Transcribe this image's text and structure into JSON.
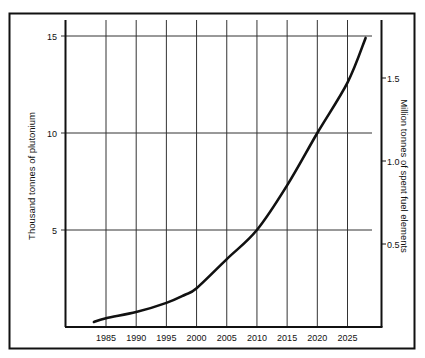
{
  "chart_data": {
    "type": "line",
    "title": "",
    "xlabel": "",
    "ylabel": "Thousand tonnes of plutonium",
    "y2label": "Million tonnes of spent fuel elements",
    "x_ticks": [
      "1985",
      "1990",
      "1995",
      "2000",
      "2005",
      "2010",
      "2015",
      "2020",
      "2025"
    ],
    "y_ticks": [
      "5",
      "10",
      "15"
    ],
    "y2_ticks": [
      "0.5",
      "1.0",
      "1.5"
    ],
    "xlim": [
      1980,
      2030
    ],
    "ylim": [
      0,
      16.8
    ],
    "y2lim": [
      0,
      1.8
    ],
    "grid": true,
    "legend": null,
    "series": [
      {
        "name": "Cumulative plutonium / spent fuel",
        "x": [
          1983,
          1985,
          1990,
          1995,
          1998,
          2000,
          2005,
          2010,
          2015,
          2020,
          2025,
          2028
        ],
        "values": [
          0.26,
          0.45,
          0.77,
          1.24,
          1.65,
          2.0,
          3.5,
          5.0,
          7.3,
          10.0,
          12.6,
          14.9
        ]
      }
    ],
    "colors": {
      "line": "#111111",
      "grid": "#333333",
      "frame": "#111111"
    }
  }
}
